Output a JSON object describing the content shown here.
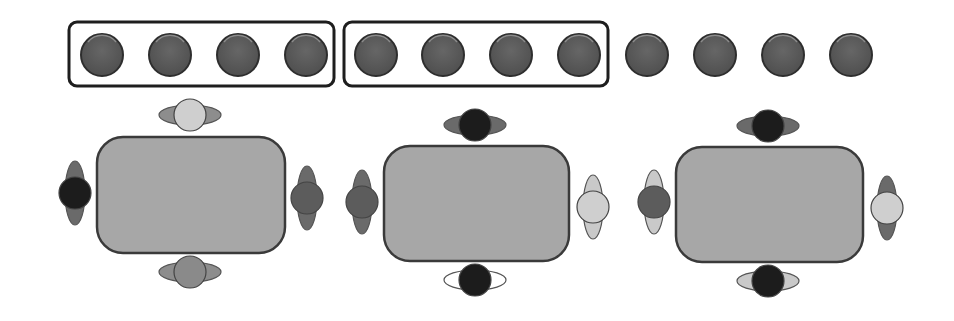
{
  "diagram": {
    "colors": {
      "background": "#ffffff",
      "counter_fill": "#5a5a5a",
      "counter_stroke": "#2e2e2e",
      "counter_highlight": "#9a9a9a",
      "group_box_stroke": "#1e1e1e",
      "table_fill": "#a7a7a7",
      "table_stroke": "#3a3a3a",
      "person_black": "#1c1c1c",
      "person_dark": "#5c5c5c",
      "person_mid": "#8a8a8a",
      "person_light": "#cfcfcf",
      "shoulders_dark": "#6a6a6a",
      "shoulders_mid": "#8d8d8d",
      "shoulders_light": "#c9c9c9",
      "shoulders_white": "#ffffff"
    },
    "counters": {
      "count": 12,
      "radius": 21,
      "cy": 55,
      "cx": [
        102,
        170,
        238,
        306,
        376,
        443,
        511,
        579,
        647,
        715,
        783,
        851
      ]
    },
    "groups": [
      {
        "label": "group-1",
        "x": 69,
        "y": 22,
        "w": 265,
        "h": 64,
        "counter_count": 4
      },
      {
        "label": "group-2",
        "x": 344,
        "y": 22,
        "w": 264,
        "h": 64,
        "counter_count": 4
      }
    ],
    "ungrouped_counter_count": 4,
    "tables": [
      {
        "x": 97,
        "y": 137,
        "w": 188,
        "h": 116,
        "people": [
          {
            "side": "top",
            "cx": 190,
            "cy": 115,
            "head": "light",
            "shoulders": "mid"
          },
          {
            "side": "bottom",
            "cx": 190,
            "cy": 272,
            "head": "mid",
            "shoulders": "mid"
          },
          {
            "side": "left",
            "cx": 75,
            "cy": 193,
            "head": "black",
            "shoulders": "dark"
          },
          {
            "side": "right",
            "cx": 307,
            "cy": 198,
            "head": "dark",
            "shoulders": "dark"
          }
        ]
      },
      {
        "x": 384,
        "y": 146,
        "w": 185,
        "h": 115,
        "people": [
          {
            "side": "top",
            "cx": 475,
            "cy": 125,
            "head": "black",
            "shoulders": "dark"
          },
          {
            "side": "bottom",
            "cx": 475,
            "cy": 280,
            "head": "black",
            "shoulders": "white"
          },
          {
            "side": "left",
            "cx": 362,
            "cy": 202,
            "head": "dark",
            "shoulders": "dark"
          },
          {
            "side": "right",
            "cx": 593,
            "cy": 207,
            "head": "light",
            "shoulders": "light"
          }
        ]
      },
      {
        "x": 676,
        "y": 147,
        "w": 187,
        "h": 115,
        "people": [
          {
            "side": "top",
            "cx": 768,
            "cy": 126,
            "head": "black",
            "shoulders": "dark"
          },
          {
            "side": "bottom",
            "cx": 768,
            "cy": 281,
            "head": "black",
            "shoulders": "light"
          },
          {
            "side": "left",
            "cx": 654,
            "cy": 202,
            "head": "dark",
            "shoulders": "light"
          },
          {
            "side": "right",
            "cx": 887,
            "cy": 208,
            "head": "light",
            "shoulders": "dark"
          }
        ]
      }
    ]
  }
}
